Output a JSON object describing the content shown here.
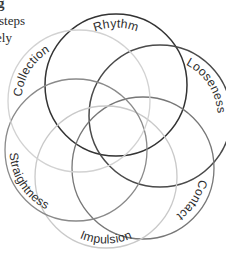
{
  "page": {
    "width": 226,
    "height": 257,
    "background": "#ffffff"
  },
  "margin_text": {
    "fragment_glyph": "g",
    "fragment_line_1": "steps",
    "fragment_line_2": "ely"
  },
  "diagram": {
    "type": "overlapping-circles-venn",
    "circle_count": 6,
    "center": {
      "x": 116,
      "y": 131
    },
    "circles": [
      {
        "id": "rhythm",
        "label": "Rhythm",
        "cx": 116,
        "cy": 85,
        "r": 71,
        "stroke": "#333333",
        "stroke_width": 1.5,
        "label_position": "top",
        "label_flipped": false
      },
      {
        "id": "looseness",
        "label": "Looseness",
        "cx": 160,
        "cy": 116,
        "r": 71,
        "stroke": "#4a4a4a",
        "stroke_width": 1.5,
        "label_position": "upper-right",
        "label_flipped": false
      },
      {
        "id": "contact",
        "label": "Contact",
        "cx": 143,
        "cy": 168,
        "r": 71,
        "stroke": "#777777",
        "stroke_width": 1.3,
        "label_position": "lower-right",
        "label_flipped": false
      },
      {
        "id": "impulsion",
        "label": "Impulsion",
        "cx": 106,
        "cy": 177,
        "r": 71,
        "stroke": "#c9c9c9",
        "stroke_width": 1.3,
        "label_position": "bottom",
        "label_flipped": true
      },
      {
        "id": "straightness",
        "label": "Straightness",
        "cx": 76,
        "cy": 150,
        "r": 71,
        "stroke": "#8a8a8a",
        "stroke_width": 1.3,
        "label_position": "lower-left",
        "label_flipped": true
      },
      {
        "id": "collection",
        "label": "Collection",
        "cx": 79,
        "cy": 101,
        "r": 71,
        "stroke": "#d2d2d2",
        "stroke_width": 1.3,
        "label_position": "upper-left",
        "label_flipped": false
      }
    ]
  }
}
